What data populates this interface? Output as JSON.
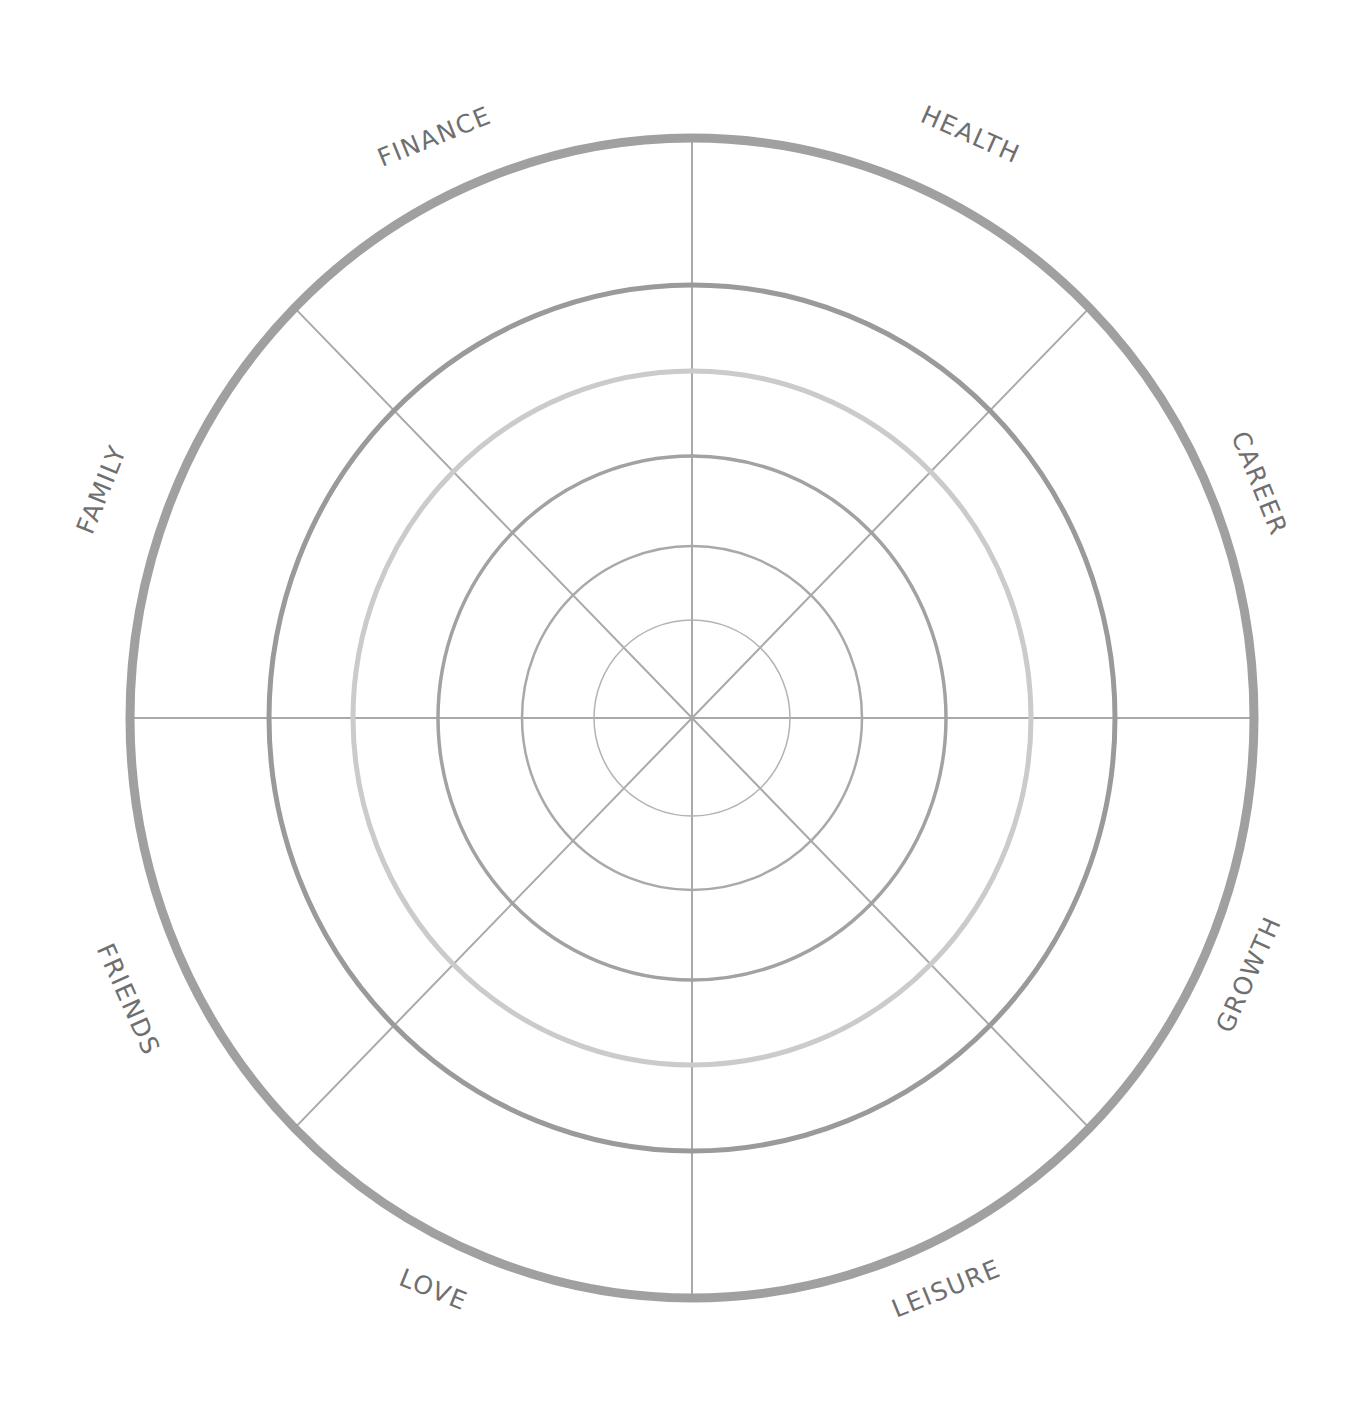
{
  "diagram": {
    "type": "wheel-of-life",
    "center": [
      692,
      718
    ],
    "spoke_count": 8,
    "colors": {
      "background": "#ffffff",
      "spoke": "#a9a9a9",
      "label": "#6f6f6f"
    },
    "rings": [
      {
        "name": "ring-1",
        "rx": 98,
        "ry": 98,
        "stroke": "#b3b3b3",
        "width": 1.5
      },
      {
        "name": "ring-2",
        "rx": 170,
        "ry": 172,
        "stroke": "#a9a9a9",
        "width": 2.5
      },
      {
        "name": "ring-3",
        "rx": 254,
        "ry": 262,
        "stroke": "#a2a2a2",
        "width": 3.5
      },
      {
        "name": "ring-4",
        "rx": 339,
        "ry": 347,
        "stroke": "#cbcbcb",
        "width": 5
      },
      {
        "name": "ring-5",
        "rx": 423,
        "ry": 433,
        "stroke": "#9a9a9a",
        "width": 5
      },
      {
        "name": "ring-outer",
        "rx": 562,
        "ry": 580,
        "stroke": "#a0a0a0",
        "width": 9
      }
    ],
    "segments": [
      {
        "label": "HEALTH",
        "angle": 22.5
      },
      {
        "label": "CAREER",
        "angle": 67.5
      },
      {
        "label": "GROWTH",
        "angle": 112.5
      },
      {
        "label": "LEISURE",
        "angle": 157.5
      },
      {
        "label": "LOVE",
        "angle": 202.5
      },
      {
        "label": "FRIENDS",
        "angle": 247.5
      },
      {
        "label": "FAMILY",
        "angle": 292.5
      },
      {
        "label": "FINANCE",
        "angle": 337.5
      }
    ],
    "label_positions": [
      {
        "x": 970,
        "y": 136,
        "rot": 24
      },
      {
        "x": 1258,
        "y": 484,
        "rot": 68
      },
      {
        "x": 1250,
        "y": 975,
        "rot": -66
      },
      {
        "x": 947,
        "y": 1290,
        "rot": -22
      },
      {
        "x": 433,
        "y": 1291,
        "rot": 22
      },
      {
        "x": 127,
        "y": 1000,
        "rot": 66
      },
      {
        "x": 103,
        "y": 490,
        "rot": -68
      },
      {
        "x": 435,
        "y": 138,
        "rot": -22
      }
    ]
  }
}
